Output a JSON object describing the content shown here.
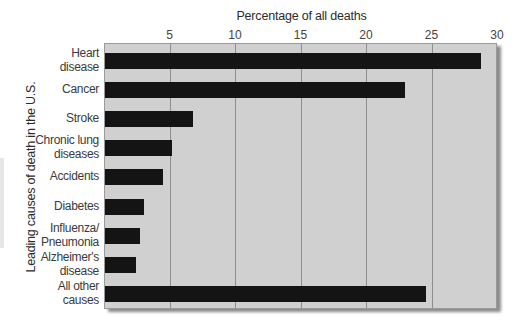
{
  "chart_data": {
    "type": "bar",
    "orientation": "horizontal",
    "title": "",
    "xlabel": "Percentage of all deaths",
    "ylabel": "Leading causes of death in the U.S.",
    "xlim": [
      0,
      30
    ],
    "xticks": [
      5,
      10,
      15,
      20,
      25,
      30
    ],
    "grid": true,
    "xaxis_position": "top",
    "categories": [
      "Heart disease",
      "Cancer",
      "Stroke",
      "Chronic lung diseases",
      "Accidents",
      "Diabetes",
      "Influenza/ Pneumonia",
      "Alzheimer's disease",
      "All other causes"
    ],
    "category_display": [
      "Heart\ndisease",
      "Cancer",
      "Stroke",
      "Chronic lung\ndiseases",
      "Accidents",
      "Diabetes",
      "Influenza/\nPneumonia",
      "Alzheimer's\ndisease",
      "All other\ncauses"
    ],
    "values": [
      28.7,
      22.9,
      6.7,
      5.1,
      4.4,
      3.0,
      2.7,
      2.4,
      24.5
    ],
    "bar_color": "#141414",
    "background_color": "#d0d0d0"
  }
}
